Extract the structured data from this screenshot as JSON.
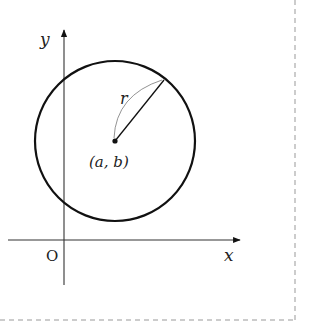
{
  "diagram": {
    "type": "circle-on-coordinate-plane",
    "axes": {
      "x_label": "x",
      "y_label": "y",
      "origin_label": "O"
    },
    "circle": {
      "center_label": "(a, b)",
      "radius_label": "r"
    },
    "colors": {
      "stroke": "#111111",
      "axis": "#333333",
      "border": "#999999"
    }
  }
}
